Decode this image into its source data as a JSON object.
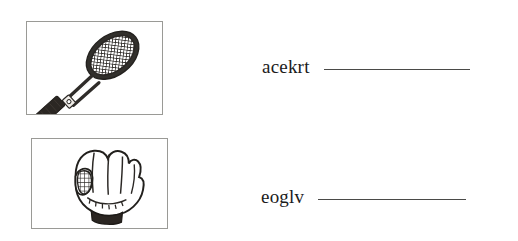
{
  "worksheet": {
    "background_color": "#ffffff",
    "ink_color": "#1b1b1b",
    "border_color": "#9a9a96",
    "blank_line_color": "#4a4a48"
  },
  "items": [
    {
      "picture": {
        "name": "tennis-racket-illustration",
        "subject": "tennis racket",
        "alt": "Line drawing of a tennis racket angled diagonally with a dark strung head and dark grip"
      },
      "scrambled_word": "acekrt",
      "answer_value": "",
      "answer_placeholder": ""
    },
    {
      "picture": {
        "name": "baseball-glove-illustration",
        "subject": "baseball glove",
        "alt": "Line drawing of a baseball glove with laced webbing and a dark wrist cuff"
      },
      "scrambled_word": "eoglv",
      "answer_value": "",
      "answer_placeholder": ""
    }
  ]
}
